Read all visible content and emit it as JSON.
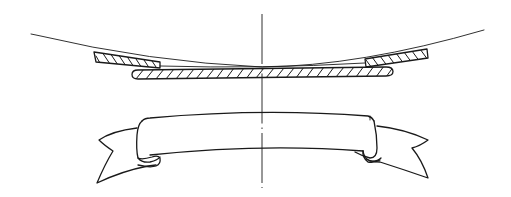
{
  "figure": {
    "type": "technical-line-drawing",
    "colors": {
      "background": "#ffffff",
      "ink": "#1a1a1a"
    },
    "elements": [
      {
        "name": "curved-sheet-line",
        "label": ""
      },
      {
        "name": "left-hatched-block",
        "label": ""
      },
      {
        "name": "right-hatched-block",
        "label": ""
      },
      {
        "name": "center-hatched-strip",
        "label": ""
      },
      {
        "name": "ribbon-banner",
        "label": ""
      },
      {
        "name": "center-axis",
        "label": ""
      }
    ]
  }
}
